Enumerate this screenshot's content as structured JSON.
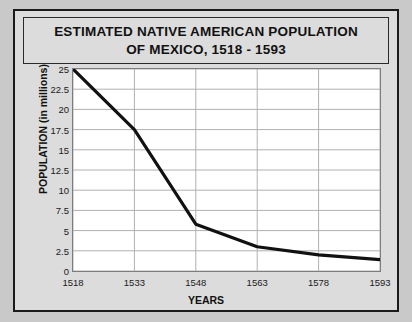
{
  "chart_data": {
    "type": "line",
    "title": "ESTIMATED NATIVE AMERICAN POPULATION OF MEXICO, 1518 - 1593",
    "title_lines": [
      "ESTIMATED NATIVE AMERICAN POPULATION",
      "OF MEXICO, 1518 - 1593"
    ],
    "xlabel": "YEARS",
    "ylabel": "POPULATION (in millions)",
    "x": [
      1518,
      1533,
      1548,
      1563,
      1578,
      1593
    ],
    "values": [
      25,
      17.5,
      5.8,
      3,
      2,
      1.4
    ],
    "categories": [
      "1518",
      "1533",
      "1548",
      "1563",
      "1578",
      "1593"
    ],
    "xticks": [
      "1518",
      "1533",
      "1548",
      "1563",
      "1578",
      "1593"
    ],
    "yticks": [
      "0",
      "2.5",
      "5",
      "7.5",
      "10",
      "12.5",
      "15",
      "17.5",
      "20",
      "22.5",
      "25"
    ],
    "ytick_values": [
      0,
      2.5,
      5,
      7.5,
      10,
      12.5,
      15,
      17.5,
      20,
      22.5,
      25
    ],
    "xlim": [
      1518,
      1593
    ],
    "ylim": [
      0,
      25
    ],
    "grid": true,
    "legend": "none",
    "line_color": "#111111",
    "grid_color": "#b0b0b0",
    "plot_background": "#ffffff",
    "figure_background": "#dcdcdc"
  }
}
